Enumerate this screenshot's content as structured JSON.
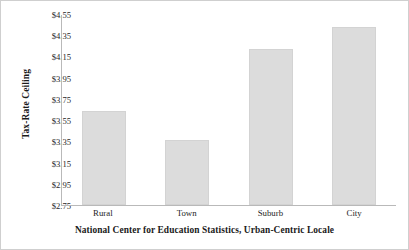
{
  "chart_data": {
    "type": "bar",
    "title": "",
    "subtitle": "",
    "xlabel": "National Center for Education Statistics, Urban-Centric Locale",
    "ylabel": "Tax-Rate Ceiling",
    "categories": [
      "Rural",
      "Town",
      "Suburb",
      "City"
    ],
    "values": [
      3.64,
      3.36,
      4.22,
      4.43
    ],
    "ylim": [
      2.75,
      4.55
    ],
    "ytick_labels": [
      "$4.55",
      "$4.35",
      "$4.15",
      "$3.95",
      "$3.75",
      "$3.55",
      "$3.35",
      "$3.15",
      "$2.95",
      "$2.75"
    ],
    "ytick_values": [
      4.55,
      4.35,
      4.15,
      3.95,
      3.75,
      3.55,
      3.35,
      3.15,
      2.95,
      2.75
    ],
    "grid": false,
    "legend": false,
    "legend_position": "none",
    "bar_color": "#dcdcdc",
    "bar_edge_color": "#d3d3d3",
    "axis_color": "#b9b9b9",
    "text_color": "#262626",
    "background_color": "#ffffff",
    "series": [
      {
        "name": "Tax-Rate Ceiling",
        "values": [
          3.64,
          3.36,
          4.22,
          4.43
        ]
      }
    ]
  }
}
